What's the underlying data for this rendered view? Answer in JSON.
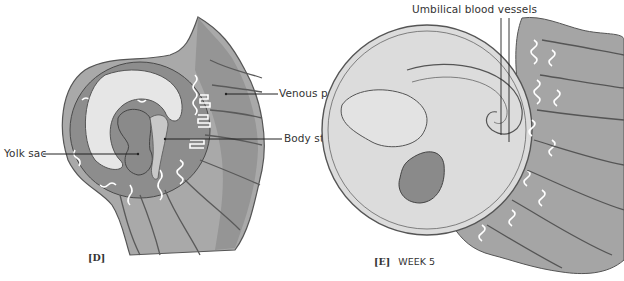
{
  "figure": {
    "panels": [
      {
        "id": "D",
        "caption_letter": "[D]",
        "caption_text": "",
        "labels": {
          "venous_pool": "Venous pool",
          "body_stalk": "Body stalk",
          "yolk_sac": "Yolk sac"
        }
      },
      {
        "id": "E",
        "caption_letter": "[E]",
        "caption_text": "WEEK 5",
        "labels": {
          "umbilical_blood_vessels": "Umbilical blood vessels"
        }
      }
    ],
    "colors": {
      "background": "#ffffff",
      "tissue_dark": "#8a8a8a",
      "tissue_mid": "#a9a9a9",
      "tissue_light": "#c8c8c8",
      "amnion": "#e6e6e6",
      "outline": "#444444",
      "leader_line": "#222222"
    }
  }
}
